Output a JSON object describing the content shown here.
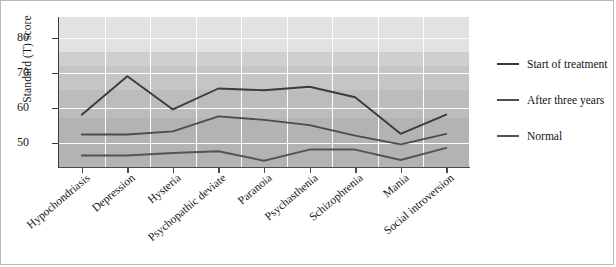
{
  "chart_data": {
    "type": "line",
    "title": "",
    "xlabel": "",
    "ylabel": "Standard (T) score",
    "categories": [
      "Hypochondriasis",
      "Depression",
      "Hysteria",
      "Psychopathic deviate",
      "Paranoia",
      "Psychasthenia",
      "Schizophrenia",
      "Mania",
      "Social introversion"
    ],
    "ylim": [
      43,
      86
    ],
    "yticks": [
      50,
      60,
      70,
      80
    ],
    "ytick_labels": [
      "50",
      "60",
      "70",
      "80"
    ],
    "grid": true,
    "legend_position": "right",
    "series": [
      {
        "name": "Start of treatment",
        "color": "#3b3b3b",
        "values": [
          58,
          69,
          59.5,
          65.5,
          65,
          66,
          63,
          52.5,
          58
        ]
      },
      {
        "name": "After three years",
        "color": "#4d4d4d",
        "values": [
          52.3,
          52.3,
          53.2,
          57.5,
          56.5,
          55,
          52,
          49.5,
          52.5
        ]
      },
      {
        "name": "Normal",
        "color": "#545454",
        "values": [
          46.3,
          46.3,
          47,
          47.5,
          44.8,
          48,
          48,
          45,
          48.5
        ]
      }
    ],
    "bands": [
      {
        "from": 76,
        "to": 86,
        "color": "#e2e2e2"
      },
      {
        "from": 72,
        "to": 76,
        "color": "#cfcfcf"
      },
      {
        "from": 65,
        "to": 72,
        "color": "#c5c5c5"
      },
      {
        "from": 57,
        "to": 65,
        "color": "#bcbcbc"
      },
      {
        "from": 43,
        "to": 57,
        "color": "#b3b3b3"
      }
    ]
  },
  "legend": {
    "items": [
      {
        "label": "Start of treatment",
        "color": "#3b3b3b"
      },
      {
        "label": "After three years",
        "color": "#4d4d4d"
      },
      {
        "label": "Normal",
        "color": "#545454"
      }
    ]
  }
}
